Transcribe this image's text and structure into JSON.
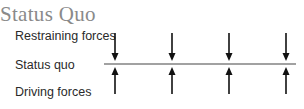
{
  "title": "Status Quo",
  "labels": {
    "restraining": "Restraining forces",
    "status_quo": "Status quo",
    "driving": "Driving forces"
  },
  "diagram": {
    "force_columns": 4,
    "restraining_direction": "down",
    "driving_direction": "up",
    "colors": {
      "title": "#8a8a8a",
      "text": "#2a2a2a",
      "arrow": "#111111",
      "line": "#444444"
    }
  }
}
